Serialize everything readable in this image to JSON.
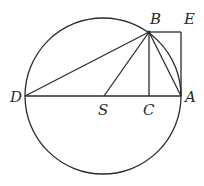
{
  "diagram": {
    "type": "geometry",
    "colors": {
      "stroke": "#2b2b2b",
      "background": "#ffffff"
    },
    "circle": {
      "center": "S",
      "cx": 103,
      "cy": 96,
      "r": 78
    },
    "points": {
      "D": {
        "x": 25,
        "y": 96,
        "label": "D"
      },
      "S": {
        "x": 104,
        "y": 96,
        "label": "S"
      },
      "C": {
        "x": 149,
        "y": 96,
        "label": "C"
      },
      "A": {
        "x": 181,
        "y": 96,
        "label": "A"
      },
      "B": {
        "x": 149,
        "y": 32,
        "label": "B"
      },
      "E": {
        "x": 181,
        "y": 32,
        "label": "E"
      }
    },
    "segments": [
      "DA",
      "DB",
      "SB",
      "BC",
      "BA",
      "BE",
      "EA"
    ],
    "labels": {
      "B": "B",
      "E": "E",
      "D": "D",
      "S": "S",
      "C": "C",
      "A": "A"
    }
  }
}
